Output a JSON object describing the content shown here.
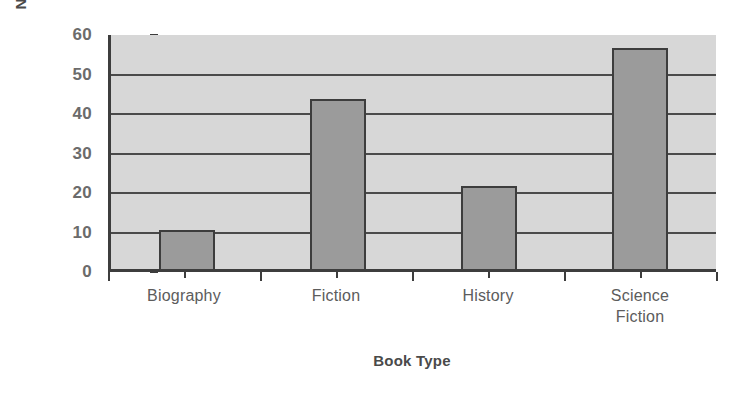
{
  "chart_data": {
    "type": "bar",
    "title": "",
    "categories": [
      "Biography",
      "Fiction",
      "History",
      "Science Fiction"
    ],
    "category_lines": [
      [
        "Biography"
      ],
      [
        "Fiction"
      ],
      [
        "History"
      ],
      [
        "Science",
        "Fiction"
      ]
    ],
    "values": [
      10,
      43,
      21,
      56
    ],
    "xlabel": "Book Type",
    "ylabel": "Number of Students",
    "ylim": [
      0,
      60
    ],
    "yticks": [
      0,
      10,
      20,
      30,
      40,
      50,
      60
    ],
    "ytick_labels": [
      "0",
      "10",
      "20",
      "30",
      "40",
      "50",
      "60"
    ],
    "grid": true,
    "grid_axis": "y",
    "legend": false,
    "bar_color": "#9b9b9b",
    "bar_edge_color": "#3d3d3d",
    "plot_background": "#d7d7d7",
    "axis_color": "#3d3d3d",
    "gridline_color": "#4a4a4a",
    "label_color": "#5c5c5c",
    "title_color": "#4a4a4a"
  }
}
